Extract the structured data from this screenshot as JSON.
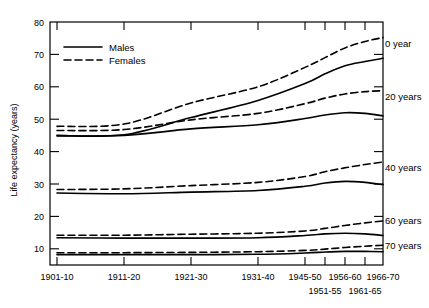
{
  "chart_data": {
    "type": "line",
    "title": "",
    "xlabel": "",
    "ylabel": "Life expectancy (years)",
    "ylim": [
      5,
      80
    ],
    "yticks": [
      10,
      20,
      30,
      40,
      50,
      60,
      70,
      80
    ],
    "grid": false,
    "legend_position": "upper-left-inside",
    "categories": [
      "1901-10",
      "1911-20",
      "1921-30",
      "1931-40",
      "1945-50",
      "1951-55",
      "1956-60",
      "1961-65",
      "1966-70"
    ],
    "x_tick_rows": [
      [
        "1901-10",
        "1911-20",
        "1921-30",
        "1931-40",
        "1945-50",
        "",
        "1956-60",
        "",
        "1966-70"
      ],
      [
        "",
        "",
        "",
        "",
        "",
        "1951-55",
        "",
        "1961-65",
        ""
      ]
    ],
    "legend": [
      {
        "name": "Males",
        "style": "solid"
      },
      {
        "name": "Females",
        "style": "dashed"
      }
    ],
    "annotations": [
      "0 year",
      "20 years",
      "40 years",
      "60 years",
      "70 years"
    ],
    "series": [
      {
        "name": "Males, age 0",
        "group": "0 year",
        "sex": "Males",
        "style": "solid",
        "values": [
          45.0,
          45.2,
          50.5,
          55.8,
          61.0,
          64.0,
          66.5,
          67.8,
          68.8
        ]
      },
      {
        "name": "Females, age 0",
        "group": "0 year",
        "sex": "Females",
        "style": "dashed",
        "values": [
          47.8,
          48.5,
          55.0,
          60.0,
          66.0,
          69.0,
          72.0,
          74.0,
          75.2
        ]
      },
      {
        "name": "Males, age 20",
        "group": "20 years",
        "sex": "Males",
        "style": "solid",
        "values": [
          44.8,
          45.0,
          47.0,
          48.3,
          50.2,
          51.3,
          52.0,
          51.8,
          51.0
        ]
      },
      {
        "name": "Females, age 20",
        "group": "20 years",
        "sex": "Females",
        "style": "dashed",
        "values": [
          46.5,
          46.8,
          49.8,
          51.8,
          54.8,
          56.5,
          57.8,
          58.5,
          58.8
        ]
      },
      {
        "name": "Males, age 40",
        "group": "40 years",
        "sex": "Males",
        "style": "solid",
        "values": [
          27.2,
          27.0,
          27.5,
          28.0,
          29.3,
          30.3,
          30.8,
          30.5,
          29.8
        ]
      },
      {
        "name": "Females, age 40",
        "group": "40 years",
        "sex": "Females",
        "style": "dashed",
        "values": [
          28.3,
          28.5,
          29.5,
          30.5,
          32.3,
          33.8,
          35.0,
          36.0,
          36.8
        ]
      },
      {
        "name": "Males, age 60",
        "group": "60 years",
        "sex": "Males",
        "style": "solid",
        "values": [
          13.4,
          13.3,
          13.3,
          13.4,
          14.1,
          14.6,
          14.8,
          14.6,
          14.1
        ]
      },
      {
        "name": "Females, age 60",
        "group": "60 years",
        "sex": "Females",
        "style": "dashed",
        "values": [
          14.2,
          14.2,
          14.5,
          14.8,
          15.5,
          16.3,
          17.2,
          18.0,
          18.6
        ]
      },
      {
        "name": "Males, age 70",
        "group": "70 years",
        "sex": "Males",
        "style": "solid",
        "values": [
          8.2,
          8.2,
          8.2,
          8.3,
          8.7,
          9.0,
          9.2,
          9.2,
          9.1
        ]
      },
      {
        "name": "Females, age 70",
        "group": "70 years",
        "sex": "Females",
        "style": "dashed",
        "values": [
          8.8,
          8.8,
          8.9,
          9.1,
          9.5,
          9.9,
          10.4,
          10.8,
          11.1
        ]
      }
    ]
  },
  "axis": {
    "y_tick_labels": [
      "80",
      "70",
      "60",
      "50",
      "40",
      "30",
      "20",
      "10"
    ],
    "y_title": "Life expectancy (years)"
  },
  "legend": {
    "males": "Males",
    "females": "Females"
  },
  "annotations": {
    "a0": "0 year",
    "a20": "20 years",
    "a40": "40 years",
    "a60": "60 years",
    "a70": "70 years"
  },
  "colors": {
    "line": "#000000",
    "background": "#ffffff"
  }
}
